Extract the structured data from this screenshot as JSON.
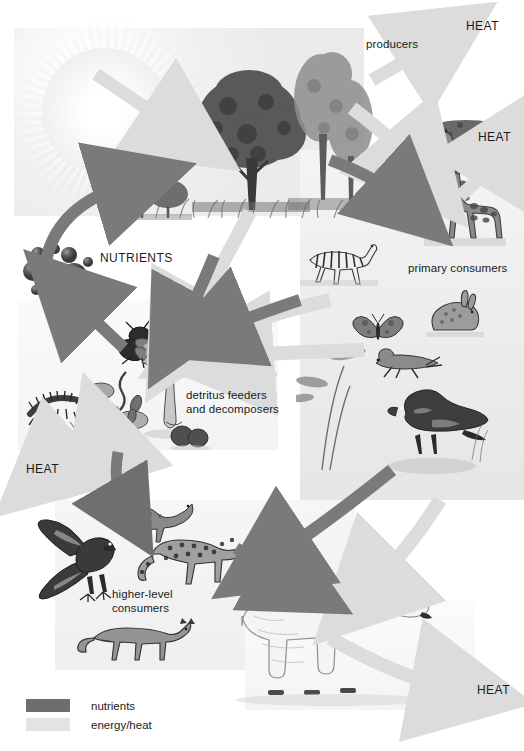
{
  "figure": {
    "width": 524,
    "height": 751
  },
  "labels": {
    "producers": "producers",
    "primary_consumers": "primary consumers",
    "higher_level_consumers": "higher-level\nconsumers",
    "detritus": "detritus feeders\nand decomposers",
    "nutrients": "NUTRIENTS",
    "heat_top_right": "HEAT",
    "heat_giraffe": "HEAT",
    "heat_left": "HEAT",
    "heat_bottom_right": "HEAT"
  },
  "legend": {
    "items": [
      {
        "label": "nutrients",
        "color": "#6e6e6e"
      },
      {
        "label": "energy/heat",
        "color": "#e3e3e3"
      }
    ]
  },
  "colors": {
    "nutrient_arrow": "#7a7a7a",
    "energy_arrow": "#dcdcdc",
    "ink": "#1b1b1b",
    "background": "#ffffff"
  },
  "organisms": {
    "sun": "sun",
    "broadleaf_tree": "broadleaf-tree",
    "conifer_tree": "conifer-tree",
    "shrub": "shrub",
    "acacia": "acacia-tree",
    "giraffe": "giraffe",
    "zebra": "zebra",
    "rabbit": "rabbit",
    "butterfly": "butterfly",
    "grasshopper": "grasshopper",
    "bird": "bird",
    "fly": "fly",
    "mushroom": "mushroom",
    "centipede": "centipede",
    "bacteria": "bacteria",
    "earthworm": "earthworm",
    "hawk": "hawk",
    "mongoose": "mongoose",
    "cheetah": "cheetah",
    "fox": "fox",
    "polar_bear": "polar-bear",
    "nutrient_spheres": "nutrient-spheres"
  }
}
